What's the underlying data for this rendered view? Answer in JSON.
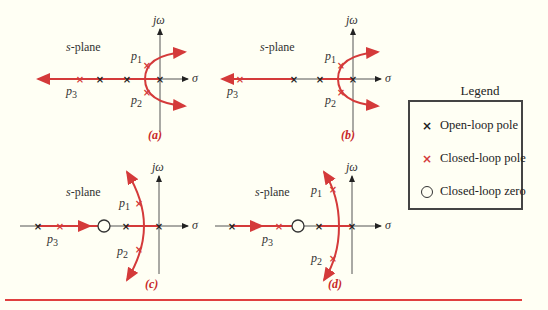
{
  "figure": {
    "panels": [
      {
        "id": "a",
        "caption": "(a)",
        "plane_label": "s-plane",
        "axis_x_label": "σ",
        "axis_y_label": "jω",
        "pole_labels": [
          "p1",
          "p2",
          "p3"
        ],
        "description": "Three open-loop poles on real axis; two branches break away and curve toward right half plane; p3 moves left along real axis"
      },
      {
        "id": "b",
        "caption": "(b)",
        "plane_label": "s-plane",
        "axis_x_label": "σ",
        "axis_y_label": "jω",
        "pole_labels": [
          "p1",
          "p2",
          "p3"
        ],
        "description": "Same as (a) with p3 farther left on real axis"
      },
      {
        "id": "c",
        "caption": "(c)",
        "plane_label": "s-plane",
        "axis_x_label": "σ",
        "axis_y_label": "jω",
        "pole_labels": [
          "p1",
          "p2",
          "p3"
        ],
        "description": "Closed-loop zero added; complex branches bend left; p3 moves right toward zero"
      },
      {
        "id": "d",
        "caption": "(d)",
        "plane_label": "s-plane",
        "axis_x_label": "σ",
        "axis_y_label": "jω",
        "pole_labels": [
          "p1",
          "p2",
          "p3"
        ],
        "description": "Closed-loop zero; p3 near zero; complex branches bend further left"
      }
    ],
    "legend": {
      "title": "Legend",
      "items": [
        {
          "symbol": "×",
          "kind": "open-loop-pole",
          "label": "Open-loop pole",
          "color": "#222222"
        },
        {
          "symbol": "×",
          "kind": "closed-loop-pole",
          "label": "Closed-loop pole",
          "color": "#d43a3a"
        },
        {
          "symbol": "○",
          "kind": "closed-loop-zero",
          "label": "Closed-loop zero",
          "color": "#333333"
        }
      ]
    },
    "colors": {
      "locus": "#d43a3a",
      "axis": "#333333",
      "background": "#fffff4",
      "rule": "#e04040"
    }
  }
}
